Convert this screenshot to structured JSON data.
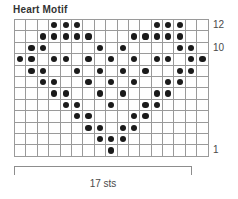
{
  "chart_data": {
    "type": "heatmap",
    "title": "Heart Motif",
    "xlabel": "17 sts",
    "ylabel": "",
    "columns": 17,
    "rows": 12,
    "grid": true,
    "legend": "none",
    "symbol": "purl-dot",
    "row_order": "bottom-to-top",
    "row_labels": [
      {
        "row": 12,
        "label": "12"
      },
      {
        "row": 10,
        "label": "10"
      },
      {
        "row": 1,
        "label": "1"
      }
    ],
    "row_label_position": "right",
    "categories": [
      1,
      2,
      3,
      4,
      5,
      6,
      7,
      8,
      9,
      10,
      11,
      12,
      13,
      14,
      15,
      16,
      17
    ],
    "series": [
      {
        "name": "Row 12",
        "row": 12,
        "values": [
          0,
          0,
          0,
          1,
          1,
          1,
          0,
          0,
          0,
          0,
          0,
          0,
          1,
          1,
          1,
          0,
          0
        ]
      },
      {
        "name": "Row 11",
        "row": 11,
        "values": [
          0,
          0,
          1,
          1,
          1,
          1,
          1,
          0,
          0,
          0,
          1,
          1,
          1,
          1,
          1,
          0,
          0
        ]
      },
      {
        "name": "Row 10",
        "row": 10,
        "values": [
          0,
          1,
          1,
          0,
          0,
          0,
          0,
          1,
          0,
          1,
          0,
          0,
          0,
          0,
          1,
          1,
          0
        ]
      },
      {
        "name": "Row 9",
        "row": 9,
        "values": [
          1,
          1,
          0,
          1,
          1,
          0,
          1,
          0,
          1,
          0,
          1,
          0,
          1,
          1,
          0,
          1,
          1
        ]
      },
      {
        "name": "Row 8",
        "row": 8,
        "values": [
          0,
          1,
          1,
          0,
          0,
          1,
          0,
          1,
          0,
          1,
          0,
          1,
          0,
          0,
          1,
          1,
          0
        ]
      },
      {
        "name": "Row 7",
        "row": 7,
        "values": [
          0,
          0,
          1,
          1,
          0,
          0,
          1,
          0,
          1,
          0,
          1,
          0,
          0,
          1,
          1,
          0,
          0
        ]
      },
      {
        "name": "Row 6",
        "row": 6,
        "values": [
          0,
          0,
          0,
          1,
          1,
          0,
          0,
          1,
          0,
          1,
          0,
          0,
          1,
          1,
          0,
          0,
          0
        ]
      },
      {
        "name": "Row 5",
        "row": 5,
        "values": [
          0,
          0,
          0,
          0,
          1,
          1,
          0,
          0,
          1,
          0,
          0,
          1,
          1,
          0,
          0,
          0,
          0
        ]
      },
      {
        "name": "Row 4",
        "row": 4,
        "values": [
          0,
          0,
          0,
          0,
          0,
          1,
          1,
          0,
          0,
          0,
          1,
          1,
          0,
          0,
          0,
          0,
          0
        ]
      },
      {
        "name": "Row 3",
        "row": 3,
        "values": [
          0,
          0,
          0,
          0,
          0,
          0,
          1,
          1,
          0,
          1,
          1,
          0,
          0,
          0,
          0,
          0,
          0
        ]
      },
      {
        "name": "Row 2",
        "row": 2,
        "values": [
          0,
          0,
          0,
          0,
          0,
          0,
          0,
          1,
          1,
          1,
          0,
          0,
          0,
          0,
          0,
          0,
          0
        ]
      },
      {
        "name": "Row 1",
        "row": 1,
        "values": [
          0,
          0,
          0,
          0,
          0,
          0,
          0,
          0,
          1,
          0,
          0,
          0,
          0,
          0,
          0,
          0,
          0
        ]
      }
    ],
    "colors": {
      "dot": "#1a1a1a",
      "cell": "#ffffff",
      "gridline": "#9a9a9a",
      "border": "#2b2b2b",
      "text": "#3a3a3a"
    }
  },
  "title": "Heart Motif",
  "bottom_bracket_caption": "17 sts"
}
